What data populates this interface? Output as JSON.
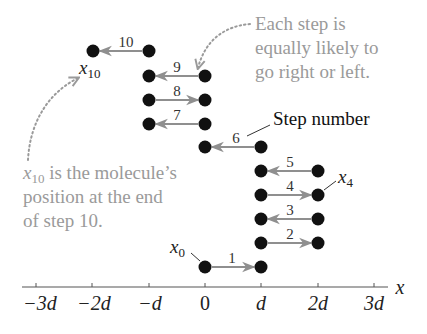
{
  "colors": {
    "dot": "#111111",
    "arrow": "#8f8f8f",
    "annotation_text": "#9a9a9a",
    "axis": "#555555"
  },
  "axis": {
    "variable": "x",
    "ticks": [
      "−3d",
      "−2d",
      "−d",
      "0",
      "d",
      "2d",
      "3d"
    ]
  },
  "steps": [
    {
      "n": "1",
      "from": "0",
      "to": "d",
      "direction": "right"
    },
    {
      "n": "2",
      "from": "d",
      "to": "2d",
      "direction": "right"
    },
    {
      "n": "3",
      "from": "2d",
      "to": "d",
      "direction": "left"
    },
    {
      "n": "4",
      "from": "d",
      "to": "2d",
      "direction": "right"
    },
    {
      "n": "5",
      "from": "2d",
      "to": "d",
      "direction": "left"
    },
    {
      "n": "6",
      "from": "d",
      "to": "0",
      "direction": "left"
    },
    {
      "n": "7",
      "from": "0",
      "to": "−d",
      "direction": "left"
    },
    {
      "n": "8",
      "from": "−d",
      "to": "0",
      "direction": "right"
    },
    {
      "n": "9",
      "from": "0",
      "to": "−d",
      "direction": "left"
    },
    {
      "n": "10",
      "from": "−d",
      "to": "−2d",
      "direction": "left"
    }
  ],
  "labels": {
    "x0_main": "x",
    "x0_sub": "0",
    "x4_main": "x",
    "x4_sub": "4",
    "x10_main": "x",
    "x10_sub": "10",
    "step_number": "Step number"
  },
  "annotations": {
    "right_note": [
      "Each step is",
      "equally likely to",
      "go right or left."
    ],
    "left_note_line1_var": "x",
    "left_note_line1_sub": "10",
    "left_note_line1_rest": " is the molecule’s",
    "left_note_line2": "position at the end",
    "left_note_line3": "of step 10."
  }
}
